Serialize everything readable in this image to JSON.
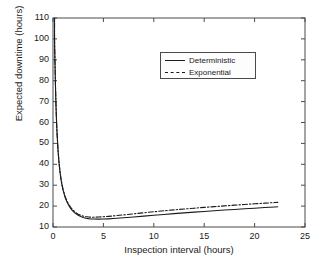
{
  "chart_data": {
    "type": "line",
    "title": "",
    "xlabel": "Inspection interval (hours)",
    "ylabel": "Expected downtime (hours)",
    "xlim": [
      0,
      25
    ],
    "ylim": [
      10,
      110
    ],
    "xticks": [
      0,
      5,
      10,
      15,
      20,
      25
    ],
    "yticks": [
      10,
      20,
      30,
      40,
      50,
      60,
      70,
      80,
      90,
      100,
      110
    ],
    "grid": false,
    "legend_position": "upper-center-right",
    "legend": [
      "Deterministic",
      "Exponential"
    ],
    "series": [
      {
        "name": "Deterministic",
        "style": "solid",
        "color": "#1a1a1a",
        "x": [
          0.15,
          0.2,
          0.25,
          0.3,
          0.35,
          0.4,
          0.5,
          0.6,
          0.7,
          0.8,
          0.9,
          1.0,
          1.2,
          1.4,
          1.6,
          1.8,
          2.0,
          2.25,
          2.5,
          2.75,
          3.0,
          3.25,
          3.5,
          3.75,
          4.0,
          4.5,
          5.0,
          5.5,
          6.0,
          7.0,
          8.0,
          9.0,
          10.0,
          11.0,
          12.0,
          13.0,
          14.0,
          15.0,
          16.0,
          17.0,
          18.0,
          19.0,
          20.0,
          21.0,
          22.0,
          22.3
        ],
        "y": [
          100.0,
          88.0,
          76.5,
          67.5,
          60.5,
          55.0,
          46.5,
          40.5,
          36.0,
          32.5,
          29.8,
          27.6,
          24.2,
          21.8,
          20.0,
          18.6,
          17.5,
          16.4,
          15.6,
          15.0,
          14.5,
          14.2,
          14.0,
          13.85,
          13.8,
          13.75,
          13.8,
          13.9,
          14.05,
          14.4,
          14.8,
          15.2,
          15.6,
          16.0,
          16.4,
          16.75,
          17.1,
          17.45,
          17.8,
          18.1,
          18.4,
          18.7,
          19.0,
          19.3,
          19.6,
          19.7
        ]
      },
      {
        "name": "Exponential",
        "style": "dashdot",
        "color": "#1a1a1a",
        "x": [
          0.15,
          0.2,
          0.25,
          0.3,
          0.35,
          0.4,
          0.5,
          0.6,
          0.7,
          0.8,
          0.9,
          1.0,
          1.2,
          1.4,
          1.6,
          1.8,
          2.0,
          2.25,
          2.5,
          2.75,
          3.0,
          3.25,
          3.5,
          3.75,
          4.0,
          4.5,
          5.0,
          5.5,
          6.0,
          7.0,
          8.0,
          9.0,
          10.0,
          11.0,
          12.0,
          13.0,
          14.0,
          15.0,
          16.0,
          17.0,
          18.0,
          19.0,
          20.0,
          21.0,
          22.0,
          22.3
        ],
        "y": [
          100.2,
          88.2,
          76.8,
          67.8,
          60.8,
          55.3,
          46.8,
          40.9,
          36.4,
          32.9,
          30.2,
          28.0,
          24.6,
          22.3,
          20.5,
          19.1,
          18.0,
          16.9,
          16.1,
          15.6,
          15.2,
          14.95,
          14.8,
          14.7,
          14.7,
          14.75,
          14.9,
          15.1,
          15.3,
          15.8,
          16.3,
          16.8,
          17.3,
          17.75,
          18.2,
          18.6,
          19.0,
          19.4,
          19.75,
          20.1,
          20.45,
          20.8,
          21.1,
          21.4,
          21.7,
          21.8
        ]
      }
    ]
  },
  "axis": {
    "x_tick_labels": [
      "0",
      "5",
      "10",
      "15",
      "20",
      "25"
    ],
    "y_tick_labels": [
      "10",
      "20",
      "30",
      "40",
      "50",
      "60",
      "70",
      "80",
      "90",
      "100",
      "110"
    ]
  },
  "legend": {
    "items": [
      {
        "label": "Deterministic",
        "style": "solid"
      },
      {
        "label": "Exponential",
        "style": "dashdot"
      }
    ]
  },
  "colors": {
    "axis": "#4a4a4a",
    "line": "#1a1a1a",
    "background": "#ffffff"
  }
}
